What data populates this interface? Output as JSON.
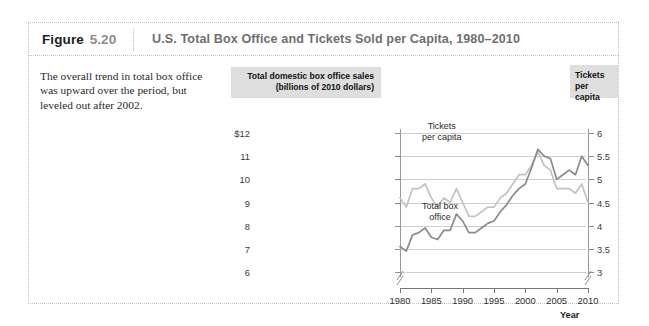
{
  "figure": {
    "label_word": "Figure",
    "number": "5.20",
    "title": "U.S. Total Box Office and Tickets Sold per Capita, 1980–2010",
    "caption": "The overall trend in total box office was upward over the period, but leveled out after 2002."
  },
  "chart_data": {
    "type": "line",
    "title": "U.S. Total Box Office and Tickets Sold per Capita, 1980–2010",
    "left_axis_header": "Total domestic box office sales (billions of 2010 dollars)",
    "right_axis_header": "Tickets per capita",
    "xlabel": "Year",
    "ylabel": "Total domestic box office sales (billions of 2010 dollars)",
    "y2label": "Tickets per capita",
    "xlim": [
      1980,
      2010
    ],
    "ylim": [
      6,
      12
    ],
    "y2lim": [
      3,
      6
    ],
    "grid": true,
    "axis_break": true,
    "legend_position": "inline-annotation",
    "left_ticks": [
      "$12",
      "11",
      "10",
      "9",
      "8",
      "7",
      "6"
    ],
    "left_tick_values": [
      12,
      11,
      10,
      9,
      8,
      7,
      6
    ],
    "right_ticks": [
      "6",
      "5.5",
      "5",
      "4.5",
      "4",
      "3.5",
      "3"
    ],
    "right_tick_values": [
      6,
      5.5,
      5,
      4.5,
      4,
      3.5,
      3
    ],
    "x_ticks": [
      "1980",
      "1985",
      "1990",
      "1995",
      "2000",
      "2005",
      "2010"
    ],
    "x_tick_values": [
      1980,
      1985,
      1990,
      1995,
      2000,
      2005,
      2010
    ],
    "x": [
      1980,
      1981,
      1982,
      1983,
      1984,
      1985,
      1986,
      1987,
      1988,
      1989,
      1990,
      1991,
      1992,
      1993,
      1994,
      1995,
      1996,
      1997,
      1998,
      1999,
      2000,
      2001,
      2002,
      2003,
      2004,
      2005,
      2006,
      2007,
      2008,
      2009,
      2010
    ],
    "series": [
      {
        "name": "Total box office",
        "annotation": "Total box\noffice",
        "color": "#8b8b8b",
        "axis": "left",
        "units": "billions of 2010 dollars",
        "values": [
          7.1,
          6.9,
          7.6,
          7.7,
          7.9,
          7.5,
          7.4,
          7.8,
          7.8,
          8.5,
          8.2,
          7.7,
          7.7,
          7.9,
          8.1,
          8.2,
          8.6,
          8.9,
          9.3,
          9.6,
          9.8,
          10.5,
          11.3,
          11.0,
          10.9,
          10.0,
          10.2,
          10.4,
          10.2,
          11.0,
          10.6
        ]
      },
      {
        "name": "Tickets per capita",
        "annotation": "Tickets\nper capita",
        "color": "#c2c2c2",
        "axis": "right",
        "units": "tickets per person per year",
        "values": [
          4.6,
          4.4,
          4.8,
          4.8,
          4.9,
          4.6,
          4.4,
          4.6,
          4.5,
          4.8,
          4.5,
          4.2,
          4.2,
          4.3,
          4.4,
          4.4,
          4.6,
          4.7,
          4.9,
          5.1,
          5.1,
          5.3,
          5.6,
          5.3,
          5.2,
          4.8,
          4.8,
          4.8,
          4.7,
          4.9,
          4.5
        ]
      }
    ]
  }
}
